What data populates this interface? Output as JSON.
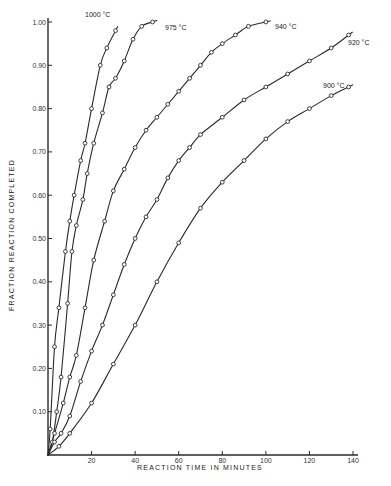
{
  "chart_data": {
    "type": "line",
    "title": "",
    "xlabel": "REACTION TIME IN MINUTES",
    "ylabel": "FRACTION REACTION COMPLETED",
    "xlim": [
      0,
      140
    ],
    "ylim": [
      0,
      1.0
    ],
    "xticks": [
      20,
      40,
      60,
      80,
      100,
      120,
      140
    ],
    "xtick_labels": [
      "20",
      "40",
      "60",
      "80",
      "100",
      "120",
      "140"
    ],
    "yticks": [
      0.1,
      0.2,
      0.3,
      0.4,
      0.5,
      0.6,
      0.7,
      0.8,
      0.9,
      1.0
    ],
    "ytick_labels": [
      "0.10",
      "0.20",
      "0.30",
      "0.40",
      "0.50",
      "0.60",
      "0.70",
      "0.80",
      "0.90",
      "1.00"
    ],
    "grid": false,
    "legend": "inline labels at curve ends",
    "series": [
      {
        "name": "1000 °C",
        "x": [
          0,
          1,
          3,
          5,
          8,
          10,
          12,
          15,
          17,
          20,
          24,
          27,
          31
        ],
        "y": [
          0,
          0.06,
          0.25,
          0.34,
          0.47,
          0.54,
          0.6,
          0.68,
          0.72,
          0.8,
          0.9,
          0.94,
          0.98
        ]
      },
      {
        "name": "975 °C",
        "x": [
          0,
          2,
          4,
          6,
          9,
          11,
          13,
          16,
          18,
          21,
          25,
          28,
          31,
          35,
          39,
          43,
          48
        ],
        "y": [
          0,
          0.03,
          0.1,
          0.18,
          0.35,
          0.47,
          0.53,
          0.59,
          0.65,
          0.72,
          0.79,
          0.85,
          0.87,
          0.91,
          0.96,
          0.99,
          1.0
        ]
      },
      {
        "name": "940 °C",
        "x": [
          0,
          3,
          7,
          10,
          13,
          17,
          21,
          26,
          30,
          35,
          40,
          45,
          50,
          55,
          60,
          65,
          70,
          75,
          80,
          86,
          92,
          100
        ],
        "y": [
          0,
          0.05,
          0.12,
          0.18,
          0.23,
          0.34,
          0.45,
          0.54,
          0.61,
          0.66,
          0.71,
          0.75,
          0.78,
          0.81,
          0.84,
          0.87,
          0.9,
          0.93,
          0.95,
          0.97,
          0.99,
          1.0
        ]
      },
      {
        "name": "920 °C",
        "x": [
          0,
          3,
          6,
          10,
          15,
          20,
          25,
          30,
          35,
          40,
          45,
          50,
          55,
          60,
          65,
          70,
          80,
          90,
          100,
          110,
          120,
          130,
          138
        ],
        "y": [
          0,
          0.03,
          0.05,
          0.09,
          0.17,
          0.24,
          0.3,
          0.37,
          0.44,
          0.5,
          0.55,
          0.59,
          0.64,
          0.68,
          0.71,
          0.74,
          0.78,
          0.82,
          0.85,
          0.88,
          0.91,
          0.94,
          0.97
        ]
      },
      {
        "name": "900 °C",
        "x": [
          0,
          5,
          10,
          20,
          30,
          40,
          50,
          60,
          70,
          80,
          90,
          100,
          110,
          120,
          130,
          138
        ],
        "y": [
          0,
          0.02,
          0.05,
          0.12,
          0.21,
          0.3,
          0.4,
          0.49,
          0.57,
          0.63,
          0.68,
          0.73,
          0.77,
          0.8,
          0.83,
          0.85
        ]
      }
    ]
  },
  "labels": {
    "series": [
      "1000 °C",
      "975 °C",
      "940 °C",
      "920 °C",
      "900 °C"
    ]
  }
}
